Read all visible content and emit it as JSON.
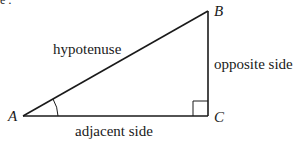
{
  "diagram": {
    "type": "right-triangle",
    "stroke_color": "#1a1a1a",
    "vertices": {
      "A": {
        "label": "A",
        "x": 23,
        "y": 116
      },
      "B": {
        "label": "B",
        "x": 208,
        "y": 11
      },
      "C": {
        "label": "C",
        "x": 208,
        "y": 116
      }
    },
    "sides": {
      "hypotenuse": "hypotenuse",
      "opposite": "opposite side",
      "adjacent": "adjacent side"
    },
    "markers": {
      "angle_at": "A",
      "right_angle_at": "C"
    },
    "cropped_header_text": "e :"
  }
}
